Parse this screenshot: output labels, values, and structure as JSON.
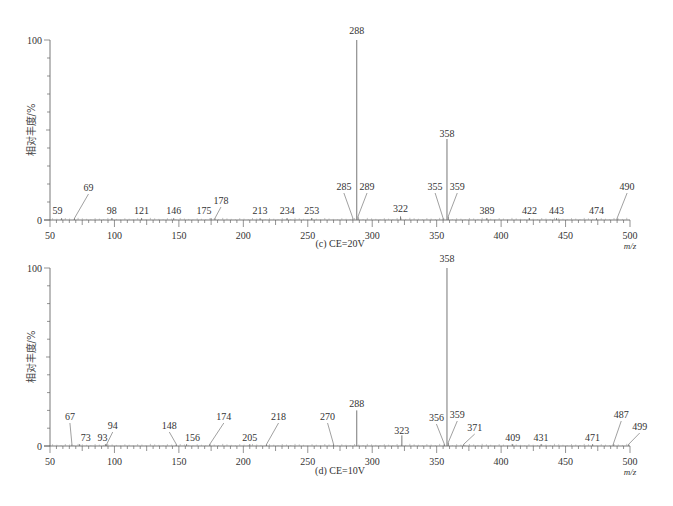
{
  "chart_data": [
    {
      "type": "bar",
      "panel": "c",
      "title": "(c) CE=20V",
      "xlabel": "m/z",
      "ylabel": "相对丰度/%",
      "xlim": [
        50,
        500
      ],
      "ylim": [
        0,
        100
      ],
      "x_ticks": [
        50,
        100,
        150,
        200,
        250,
        300,
        350,
        400,
        450,
        500
      ],
      "y_ticks": [
        0,
        100
      ],
      "grid": false,
      "peaks": [
        {
          "mz": 59,
          "value": 1,
          "label": "59"
        },
        {
          "mz": 69,
          "value": 1,
          "label": "69"
        },
        {
          "mz": 98,
          "value": 1,
          "label": "98"
        },
        {
          "mz": 121,
          "value": 1,
          "label": "121"
        },
        {
          "mz": 146,
          "value": 1,
          "label": "146"
        },
        {
          "mz": 175,
          "value": 1,
          "label": "175"
        },
        {
          "mz": 178,
          "value": 1,
          "label": "178"
        },
        {
          "mz": 213,
          "value": 1,
          "label": "213"
        },
        {
          "mz": 234,
          "value": 1,
          "label": "234"
        },
        {
          "mz": 253,
          "value": 1,
          "label": "253"
        },
        {
          "mz": 285,
          "value": 1,
          "label": "285"
        },
        {
          "mz": 288,
          "value": 100,
          "label": "288"
        },
        {
          "mz": 289,
          "value": 2,
          "label": "289"
        },
        {
          "mz": 322,
          "value": 2,
          "label": "322"
        },
        {
          "mz": 355,
          "value": 1,
          "label": "355"
        },
        {
          "mz": 358,
          "value": 45,
          "label": "358"
        },
        {
          "mz": 359,
          "value": 2,
          "label": "359"
        },
        {
          "mz": 389,
          "value": 1,
          "label": "389"
        },
        {
          "mz": 422,
          "value": 1,
          "label": "422"
        },
        {
          "mz": 443,
          "value": 1,
          "label": "443"
        },
        {
          "mz": 474,
          "value": 1,
          "label": "474"
        },
        {
          "mz": 490,
          "value": 1,
          "label": "490"
        }
      ]
    },
    {
      "type": "bar",
      "panel": "d",
      "title": "(d) CE=10V",
      "xlabel": "m/z",
      "ylabel": "相对丰度/%",
      "xlim": [
        50,
        500
      ],
      "ylim": [
        0,
        100
      ],
      "x_ticks": [
        50,
        100,
        150,
        200,
        250,
        300,
        350,
        400,
        450,
        500
      ],
      "y_ticks": [
        0,
        100
      ],
      "grid": false,
      "peaks": [
        {
          "mz": 67,
          "value": 1,
          "label": "67"
        },
        {
          "mz": 73,
          "value": 1,
          "label": "73"
        },
        {
          "mz": 93,
          "value": 1,
          "label": "93"
        },
        {
          "mz": 94,
          "value": 1,
          "label": "94"
        },
        {
          "mz": 148,
          "value": 1,
          "label": "148"
        },
        {
          "mz": 156,
          "value": 1,
          "label": "156"
        },
        {
          "mz": 174,
          "value": 1,
          "label": "174"
        },
        {
          "mz": 205,
          "value": 1,
          "label": "205"
        },
        {
          "mz": 218,
          "value": 1,
          "label": "218"
        },
        {
          "mz": 270,
          "value": 1,
          "label": "270"
        },
        {
          "mz": 288,
          "value": 20,
          "label": "288"
        },
        {
          "mz": 323,
          "value": 6,
          "label": "323"
        },
        {
          "mz": 356,
          "value": 1,
          "label": "356"
        },
        {
          "mz": 358,
          "value": 100,
          "label": "358"
        },
        {
          "mz": 359,
          "value": 2,
          "label": "359"
        },
        {
          "mz": 371,
          "value": 1,
          "label": "371"
        },
        {
          "mz": 409,
          "value": 1,
          "label": "409"
        },
        {
          "mz": 431,
          "value": 1,
          "label": "431"
        },
        {
          "mz": 471,
          "value": 1,
          "label": "471"
        },
        {
          "mz": 487,
          "value": 1,
          "label": "487"
        },
        {
          "mz": 499,
          "value": 1,
          "label": "499"
        }
      ]
    }
  ]
}
